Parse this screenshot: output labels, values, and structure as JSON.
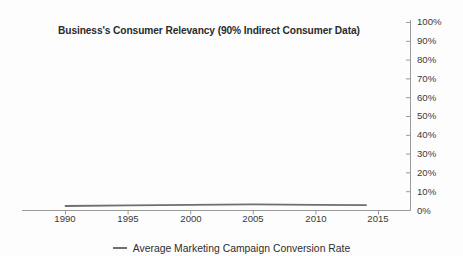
{
  "chart_data": {
    "type": "line",
    "title": "Business's Consumer Relevancy (90% Indirect Consumer Data)",
    "xlabel": "",
    "ylabel": "",
    "xlim": [
      1988,
      2016
    ],
    "ylim": [
      0,
      100
    ],
    "grid": false,
    "legend_position": "bottom",
    "y_tick_labels": [
      "100%",
      "90%",
      "80%",
      "70%",
      "60%",
      "50%",
      "40%",
      "30%",
      "20%",
      "10%",
      "0%"
    ],
    "y_tick_values": [
      100,
      90,
      80,
      70,
      60,
      50,
      40,
      30,
      20,
      10,
      0
    ],
    "x_tick_labels": [
      "1990",
      "1995",
      "2000",
      "2005",
      "2010",
      "2015"
    ],
    "x_tick_values": [
      1990,
      1995,
      2000,
      2005,
      2010,
      2015
    ],
    "x": [
      1990,
      1995,
      2000,
      2005,
      2010,
      2014
    ],
    "series": [
      {
        "name": "Average Marketing Campaign Conversion Rate",
        "color": "#6f6f6f",
        "values": [
          2.4,
          2.7,
          3.0,
          3.3,
          3.0,
          2.8
        ]
      }
    ],
    "axis_color": "#9a9a9a",
    "text_color": "#3a3a3a",
    "background_color": "#fdfdfd"
  },
  "legend": {
    "entry_label": "Average Marketing Campaign Conversion Rate"
  },
  "axes": {
    "y_axis_side": "right",
    "x_axis_side": "bottom"
  }
}
